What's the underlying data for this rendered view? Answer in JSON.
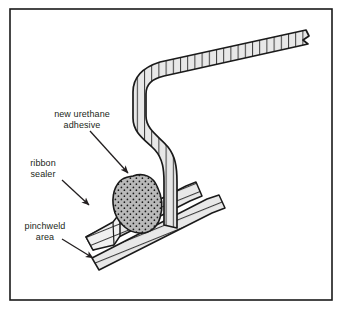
{
  "figure": {
    "background_color": "#ffffff",
    "border_color": "#1a1a1a",
    "line_color": "#1a1a1a",
    "hatch_fill_color": "#e8e8e8",
    "hatch_line_color": "#3a3a3a",
    "sealer_fill_color": "#f0f0f0",
    "adhesive_fill_color": "#b9b9b9",
    "adhesive_stipple_color": "#1a1a1a",
    "text_color": "#231f20"
  },
  "labels": {
    "adhesive": {
      "line1": "new urethane",
      "line2": "adhesive"
    },
    "sealer": {
      "line1": "ribbon",
      "line2": "sealer"
    },
    "pinchweld": {
      "line1": "pinchweld",
      "line2": "area"
    }
  },
  "parts": {
    "glass": "glass-panel",
    "adhesive_bead": "urethane-adhesive-bead",
    "ribbon_sealer": "ribbon-sealer-block",
    "pinchweld_upper": "pinchweld-upper-flange",
    "pinchweld_lower": "pinchweld-lower-flange"
  }
}
